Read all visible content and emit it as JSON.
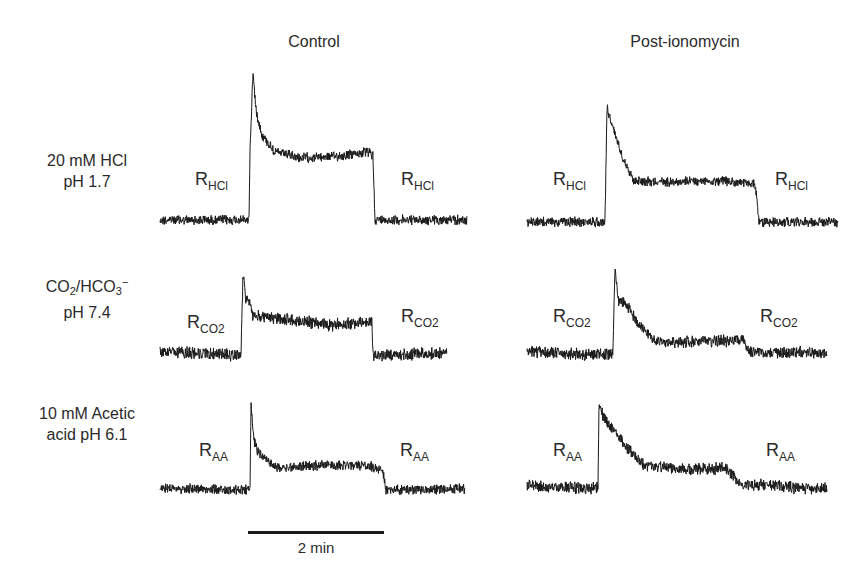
{
  "columns": [
    {
      "title": "Control",
      "x": 314
    },
    {
      "title": "Post-ionomycin",
      "x": 685
    }
  ],
  "rows": [
    {
      "label_lines": [
        "20 mM HCl",
        "pH 1.7"
      ],
      "label_html_id": "hcl",
      "label_x": 87,
      "label_y": 150
    },
    {
      "label_lines": [
        "CO2/HCO3-",
        "pH 7.4"
      ],
      "label_html_id": "co2",
      "label_x": 87,
      "label_y": 274
    },
    {
      "label_lines": [
        "10 mM Acetic",
        "acid pH 6.1"
      ],
      "label_html_id": "aa",
      "label_x": 87,
      "label_y": 403
    }
  ],
  "row_label_parts": {
    "co2": {
      "co": "CO",
      "sub2": "2",
      "slash": "/HCO",
      "sub3": "3",
      "sup": "−",
      "line2": "pH 7.4"
    }
  },
  "scale_bar": {
    "label": "2 min",
    "x1": 248,
    "x2": 384,
    "y": 533,
    "label_x": 316,
    "label_y": 540
  },
  "chart_data": {
    "type": "line",
    "title": "",
    "column_titles": [
      "Control",
      "Post-ionomycin"
    ],
    "row_titles": [
      "20 mM HCl pH 1.7",
      "CO2/HCO3− pH 7.4",
      "10 mM Acetic acid pH 6.1"
    ],
    "xlabel": "time (scale bar = 2 min)",
    "ylabel": "",
    "grid": false,
    "legend": "none",
    "panels": [
      {
        "name": "HCl-control",
        "row": 0,
        "col": 0,
        "annotations": [
          {
            "text": "R",
            "sub": "HCl",
            "x": 195,
            "y": 169
          },
          {
            "text": "R",
            "sub": "HCl",
            "x": 401,
            "y": 169
          }
        ],
        "points": [
          [
            160,
            220
          ],
          [
            249,
            220
          ],
          [
            250,
            150
          ],
          [
            253,
            72
          ],
          [
            256,
            110
          ],
          [
            262,
            135
          ],
          [
            275,
            152
          ],
          [
            300,
            158
          ],
          [
            340,
            156
          ],
          [
            368,
            152
          ],
          [
            373,
            156
          ],
          [
            375,
            220
          ],
          [
            467,
            220
          ]
        ],
        "noise": 4
      },
      {
        "name": "HCl-post",
        "row": 0,
        "col": 1,
        "annotations": [
          {
            "text": "R",
            "sub": "HCl",
            "x": 553,
            "y": 169
          },
          {
            "text": "R",
            "sub": "HCl",
            "x": 775,
            "y": 169
          }
        ],
        "points": [
          [
            527,
            222
          ],
          [
            605,
            222
          ],
          [
            607,
            107
          ],
          [
            612,
            125
          ],
          [
            622,
            155
          ],
          [
            633,
            180
          ],
          [
            660,
            182
          ],
          [
            720,
            181
          ],
          [
            755,
            184
          ],
          [
            757,
            200
          ],
          [
            759,
            222
          ],
          [
            838,
            222
          ]
        ],
        "noise": 4
      },
      {
        "name": "CO2-control",
        "row": 1,
        "col": 0,
        "annotations": [
          {
            "text": "R",
            "sub": "CO2",
            "x": 187,
            "y": 312
          },
          {
            "text": "R",
            "sub": "CO2",
            "x": 401,
            "y": 306
          }
        ],
        "points": [
          [
            160,
            352
          ],
          [
            241,
            355
          ],
          [
            243,
            273
          ],
          [
            246,
            300
          ],
          [
            250,
            302
          ],
          [
            252,
            316
          ],
          [
            290,
            320
          ],
          [
            330,
            325
          ],
          [
            372,
            322
          ],
          [
            373,
            356
          ],
          [
            447,
            353
          ]
        ],
        "noise": 5
      },
      {
        "name": "CO2-post",
        "row": 1,
        "col": 1,
        "annotations": [
          {
            "text": "R",
            "sub": "CO2",
            "x": 553,
            "y": 306
          },
          {
            "text": "R",
            "sub": "CO2",
            "x": 760,
            "y": 306
          }
        ],
        "points": [
          [
            527,
            352
          ],
          [
            613,
            355
          ],
          [
            615,
            262
          ],
          [
            618,
            300
          ],
          [
            625,
            304
          ],
          [
            640,
            325
          ],
          [
            655,
            342
          ],
          [
            700,
            342
          ],
          [
            743,
            340
          ],
          [
            748,
            352
          ],
          [
            827,
            353
          ]
        ],
        "noise": 5
      },
      {
        "name": "AA-control",
        "row": 2,
        "col": 0,
        "annotations": [
          {
            "text": "R",
            "sub": "AA",
            "x": 199,
            "y": 440
          },
          {
            "text": "R",
            "sub": "AA",
            "x": 400,
            "y": 440
          }
        ],
        "points": [
          [
            160,
            488
          ],
          [
            250,
            490
          ],
          [
            251,
            405
          ],
          [
            254,
            440
          ],
          [
            258,
            452
          ],
          [
            268,
            462
          ],
          [
            280,
            468
          ],
          [
            320,
            465
          ],
          [
            370,
            466
          ],
          [
            383,
            471
          ],
          [
            386,
            490
          ],
          [
            465,
            489
          ]
        ],
        "noise": 4
      },
      {
        "name": "AA-post",
        "row": 2,
        "col": 1,
        "annotations": [
          {
            "text": "R",
            "sub": "AA",
            "x": 553,
            "y": 440
          },
          {
            "text": "R",
            "sub": "AA",
            "x": 766,
            "y": 440
          }
        ],
        "points": [
          [
            527,
            486
          ],
          [
            598,
            488
          ],
          [
            599,
            407
          ],
          [
            605,
            420
          ],
          [
            615,
            432
          ],
          [
            628,
            448
          ],
          [
            645,
            466
          ],
          [
            690,
            470
          ],
          [
            727,
            468
          ],
          [
            740,
            484
          ],
          [
            827,
            489
          ]
        ],
        "noise": 5
      }
    ]
  },
  "style": {
    "trace_color": "#1a1a1a",
    "text_color": "#2a2a2a"
  }
}
